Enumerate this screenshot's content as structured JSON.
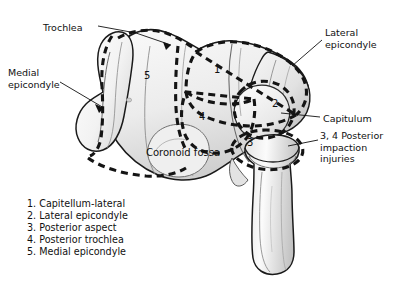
{
  "figure": {
    "background": "#ffffff",
    "ink": "#111111",
    "bone_fill_light": "#f4f4f4",
    "bone_fill_mid": "#d8d8d8",
    "bone_fill_dark": "#b5b5b5",
    "dash_color": "#141414"
  },
  "callouts": [
    {
      "id": "trochlea",
      "text": "Trochlea",
      "x": 43,
      "y": 22,
      "align": "left"
    },
    {
      "id": "medial-epicondyle",
      "text": "Medial\nepicondyle",
      "x": 8,
      "y": 67,
      "align": "left"
    },
    {
      "id": "lateral-epicondyle",
      "text": "Lateral\nepicondyle",
      "x": 325,
      "y": 27,
      "align": "left"
    },
    {
      "id": "capitulum",
      "text": "Capitulum",
      "x": 323,
      "y": 113,
      "align": "left"
    },
    {
      "id": "posterior-impaction",
      "text": "3, 4 Posterior\nimpaction\ninjuries",
      "x": 320,
      "y": 130,
      "align": "left"
    }
  ],
  "fossa_label": {
    "text": "Coronoid\nfossa",
    "x": 146,
    "y": 147
  },
  "zone_numbers": [
    {
      "n": "1",
      "x": 214,
      "y": 64
    },
    {
      "n": "2",
      "x": 272,
      "y": 98
    },
    {
      "n": "3",
      "x": 247,
      "y": 137
    },
    {
      "n": "4",
      "x": 199,
      "y": 111
    },
    {
      "n": "5",
      "x": 144,
      "y": 70
    }
  ],
  "legend": {
    "items": [
      "1. Capitellum-lateral",
      "2. Lateral epicondyle",
      "3. Posterior aspect",
      "4. Posterior trochlea",
      "5. Medial epicondyle"
    ]
  }
}
